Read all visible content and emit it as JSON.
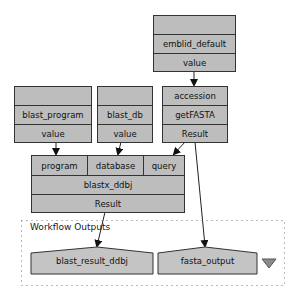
{
  "nodes": {
    "emblid_default": {
      "header": "",
      "name": "emblid_default",
      "port": "value"
    },
    "blast_program": {
      "header": "",
      "name": "blast_program",
      "port": "value"
    },
    "blast_db": {
      "header": "",
      "name": "blast_db",
      "port": "value"
    },
    "getFASTA": {
      "input": "accession",
      "name": "getFASTA",
      "output": "Result"
    },
    "blastx_ddbj": {
      "inputs": [
        "program",
        "database",
        "query"
      ],
      "name": "blastx_ddbj",
      "output": "Result"
    }
  },
  "workflow_outputs": {
    "title": "Workflow Outputs",
    "outputs": [
      "blast_result_ddbj",
      "fasta_output"
    ],
    "collapse_icon": "triangle-down-icon"
  },
  "edges": [
    {
      "from": "emblid_default.value",
      "to": "getFASTA.accession"
    },
    {
      "from": "blast_program.value",
      "to": "blastx_ddbj.program"
    },
    {
      "from": "blast_db.value",
      "to": "blastx_ddbj.database"
    },
    {
      "from": "getFASTA.Result",
      "to": "blastx_ddbj.query"
    },
    {
      "from": "getFASTA.Result",
      "to": "fasta_output"
    },
    {
      "from": "blastx_ddbj.Result",
      "to": "blast_result_ddbj"
    }
  ],
  "colors": {
    "node_fill": "#bdbdbd",
    "border": "#333333",
    "output_fill": "#c4c4c4"
  }
}
